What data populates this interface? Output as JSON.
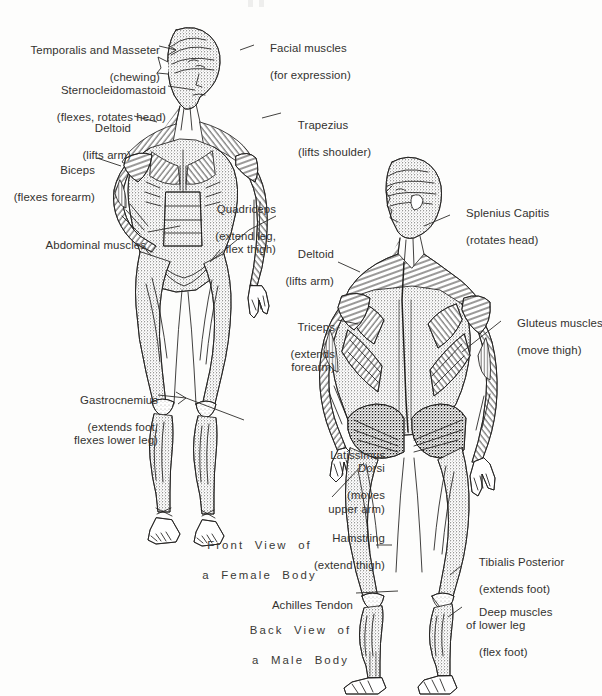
{
  "figure": {
    "background_color": "#fdfdfc",
    "ink_color": "#33322f"
  },
  "captions": [
    {
      "id": "front-view-caption",
      "line1": "Front  View  of",
      "line2": "a  Female  Body"
    },
    {
      "id": "back-view-caption",
      "line1": "Back  View  of",
      "line2": "a  Male  Body"
    }
  ],
  "labels": [
    {
      "id": "temporalis-masseter",
      "name": "Temporalis and Masseter",
      "function": "(chewing)",
      "align": "right",
      "column": "left"
    },
    {
      "id": "facial-muscles",
      "name": "Facial muscles",
      "function": "(for expression)",
      "align": "left",
      "column": "center-right"
    },
    {
      "id": "sternocleidomastoid",
      "name": "Sternocleidomastoid",
      "function": "(flexes, rotates head)",
      "align": "right",
      "column": "left"
    },
    {
      "id": "deltoid-front",
      "name": "Deltoid",
      "function": "(lifts arm)",
      "align": "right",
      "column": "left"
    },
    {
      "id": "trapezius",
      "name": "Trapezius",
      "function": "(lifts shoulder)",
      "align": "left",
      "column": "center"
    },
    {
      "id": "biceps",
      "name": "Biceps",
      "function": "(flexes forearm)",
      "align": "right",
      "column": "left"
    },
    {
      "id": "splenius-capitis",
      "name": "Splenius Capitis",
      "function": "(rotates head)",
      "align": "left",
      "column": "right"
    },
    {
      "id": "quadriceps",
      "name": "Quadriceps",
      "function": "(extend leg,\nflex thigh)",
      "align": "right",
      "column": "center"
    },
    {
      "id": "abdominal-muscles",
      "name": "Abdominal muscles",
      "function": "",
      "align": "right",
      "column": "left"
    },
    {
      "id": "deltoid-back",
      "name": "Deltoid",
      "function": "(lifts arm)",
      "align": "right",
      "column": "center"
    },
    {
      "id": "triceps",
      "name": "Triceps",
      "function": "(extends\nforearm)",
      "align": "right",
      "column": "center"
    },
    {
      "id": "gluteus-muscles",
      "name": "Gluteus muscles",
      "function": "(move thigh)",
      "align": "left",
      "column": "right"
    },
    {
      "id": "gastrocnemius",
      "name": "Gastrocnemius",
      "function": "(extends foot,\nflexes lower leg)",
      "align": "right",
      "column": "left"
    },
    {
      "id": "latissimus-dorsi",
      "name": "Latissimus\nDorsi",
      "function": "(moves\nupper arm)",
      "align": "right",
      "column": "center"
    },
    {
      "id": "hamstring",
      "name": "Hamstring",
      "function": "(extend thigh)",
      "align": "right",
      "column": "center"
    },
    {
      "id": "tibialis-posterior",
      "name": "Tibialis Posterior",
      "function": "(extends foot)",
      "align": "left",
      "column": "right"
    },
    {
      "id": "achilles-tendon",
      "name": "Achilles Tendon",
      "function": "",
      "align": "right",
      "column": "center"
    },
    {
      "id": "deep-muscles-lower-leg",
      "name": "Deep muscles\nof lower leg",
      "function": "(flex foot)",
      "align": "left",
      "column": "right"
    }
  ]
}
